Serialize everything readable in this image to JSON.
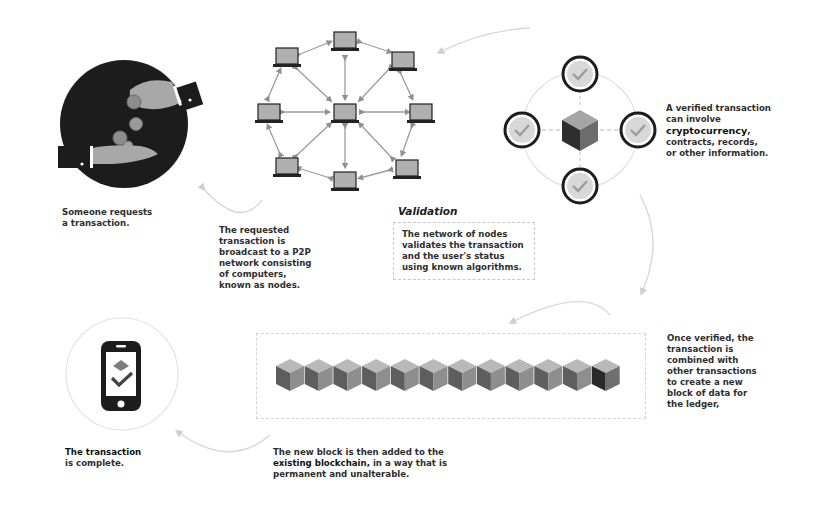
{
  "steps": {
    "request": {
      "text": "Someone requests a transaction.",
      "line1": "Someone requests",
      "line2": "a transaction."
    },
    "broadcast": {
      "lines": [
        "The requested",
        "transaction is",
        "broadcast to a P2P",
        "network consisting",
        "of computers,",
        "known as nodes."
      ]
    },
    "validation": {
      "title": "Validation",
      "lines": [
        "The network of nodes",
        "validates the transaction",
        "and the user's status",
        "using known algorithms."
      ]
    },
    "verified": {
      "line1": "A verified transaction",
      "line2": "can involve",
      "highlight": "cryptocurrency",
      "line3_suffix": ",",
      "line4": "contracts, records,",
      "line5": "or other information."
    },
    "combined": {
      "lines": [
        "Once verified, the",
        "transaction is",
        "combined with",
        "other transactions",
        "to create a new",
        "block of data for",
        "the ledger,"
      ]
    },
    "added": {
      "line1": "The new block is then added to the",
      "line2_bold": "existing blockchain,",
      "line2_rest": " in a way that is",
      "line3": "permanent and unalterable."
    },
    "complete": {
      "line1": "The transaction",
      "line2": "is complete."
    }
  },
  "network": {
    "node_count": 9,
    "center_node": "center"
  },
  "blockchain": {
    "block_count": 12,
    "new_block_index": 11
  },
  "colors": {
    "dark": "#1e1e1e",
    "cube_top": "#b9b9b9",
    "cube_left": "#5e5e5e",
    "cube_right": "#8e8e8e",
    "new_cube_left": "#2a2a2a",
    "new_cube_right": "#6f6f6f",
    "check_fill": "#d8d8d8",
    "arrow": "#d6d6d6"
  }
}
